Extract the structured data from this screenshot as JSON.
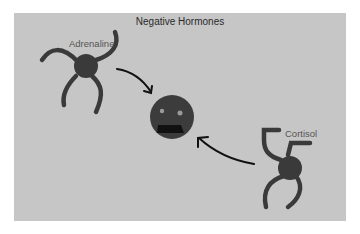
{
  "diagram": {
    "title": "Negative Hormones",
    "hormones": [
      {
        "name": "Adrenaline",
        "shape": "four-armed-blob"
      },
      {
        "name": "Cortisol",
        "shape": "four-armed-blob"
      }
    ],
    "target": {
      "label": "",
      "shape": "distressed-face"
    },
    "arrows": [
      {
        "from": "Adrenaline",
        "to": "face"
      },
      {
        "from": "Cortisol",
        "to": "face"
      }
    ],
    "colors": {
      "panel": "#c6c6c6",
      "figure": "#3a3a3a",
      "arrow": "#111111",
      "text": "#2a2a2a"
    }
  }
}
